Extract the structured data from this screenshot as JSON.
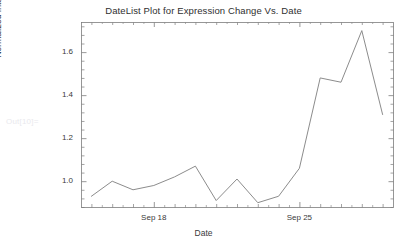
{
  "notebook": {
    "out_label": "Out[10]="
  },
  "chart_data": {
    "type": "line",
    "title": "DateList Plot for Expression Change Vs. Date",
    "xlabel": "Date",
    "ylabel": "Normalized Intensity",
    "grid": false,
    "legend": null,
    "legend_position": "none",
    "frame": true,
    "line_color": "#8c8c8c",
    "x_type": "date",
    "x": [
      "Sep 15",
      "Sep 16",
      "Sep 17",
      "Sep 18",
      "Sep 19",
      "Sep 20",
      "Sep 21",
      "Sep 22",
      "Sep 23",
      "Sep 24",
      "Sep 25",
      "Sep 26",
      "Sep 27",
      "Sep 28",
      "Sep 29"
    ],
    "values": [
      0.93,
      1.0,
      0.96,
      0.98,
      1.02,
      1.07,
      0.91,
      1.01,
      0.9,
      0.93,
      1.06,
      1.48,
      1.46,
      1.7,
      1.31
    ],
    "xlim": [
      "Sep 14.5",
      "Sep 29.5"
    ],
    "ylim": [
      0.88,
      1.74
    ],
    "xtick_labels": [
      "Sep 18",
      "Sep 25"
    ],
    "xtick_values": [
      "Sep 18",
      "Sep 25"
    ],
    "ytick_labels": [
      "1.0",
      "1.2",
      "1.4",
      "1.6"
    ],
    "ytick_values": [
      1.0,
      1.2,
      1.4,
      1.6
    ],
    "y_minor_count": 4,
    "x_minor_count": 1
  }
}
